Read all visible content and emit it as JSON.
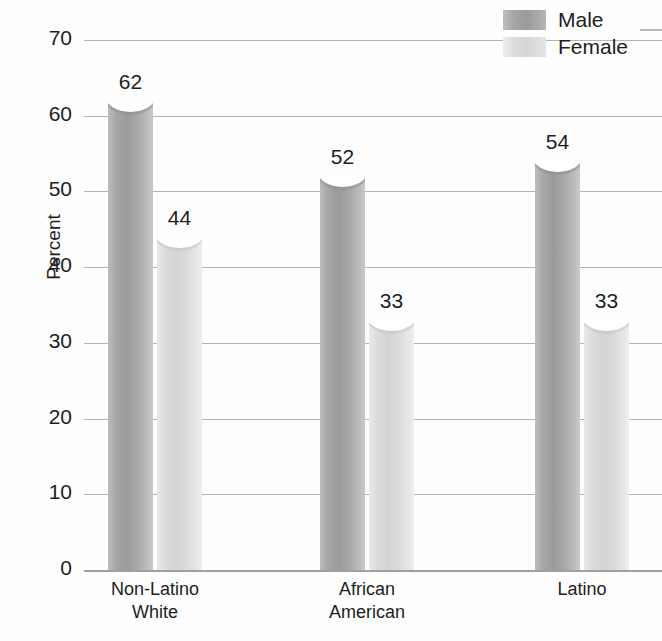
{
  "chart_data": {
    "type": "bar",
    "title": "",
    "xlabel": "",
    "ylabel": "Percent",
    "ylim": [
      0,
      70
    ],
    "ytick_step": 10,
    "grid": true,
    "legend_position": "top-right",
    "categories": [
      "Non-Latino\nWhite",
      "African\nAmerican",
      "Latino"
    ],
    "yticks": [
      "0",
      "10",
      "20",
      "30",
      "40",
      "50",
      "60",
      "70"
    ],
    "series": [
      {
        "name": "Male",
        "values": [
          62,
          52,
          54
        ],
        "color": "#a6a6a6"
      },
      {
        "name": "Female",
        "values": [
          44,
          33,
          33
        ],
        "color": "#dcdcdc"
      }
    ]
  },
  "axis": {
    "y_title": "Percent",
    "ticks": [
      {
        "label": "70",
        "value": 70
      },
      {
        "label": "60",
        "value": 60
      },
      {
        "label": "50",
        "value": 50
      },
      {
        "label": "40",
        "value": 40
      },
      {
        "label": "30",
        "value": 30
      },
      {
        "label": "20",
        "value": 20
      },
      {
        "label": "10",
        "value": 10
      },
      {
        "label": "0",
        "value": 0
      }
    ]
  },
  "groups": [
    {
      "label": "Non-Latino\nWhite",
      "bars": [
        {
          "series": "Male",
          "value": 62,
          "value_label": "62"
        },
        {
          "series": "Female",
          "value": 44,
          "value_label": "44"
        }
      ]
    },
    {
      "label": "African\nAmerican",
      "bars": [
        {
          "series": "Male",
          "value": 52,
          "value_label": "52"
        },
        {
          "series": "Female",
          "value": 33,
          "value_label": "33"
        }
      ]
    },
    {
      "label": "Latino",
      "bars": [
        {
          "series": "Male",
          "value": 54,
          "value_label": "54"
        },
        {
          "series": "Female",
          "value": 33,
          "value_label": "33"
        }
      ]
    }
  ],
  "legend": {
    "items": [
      {
        "label": "Male",
        "color": "#a6a6a6"
      },
      {
        "label": "Female",
        "color": "#dcdcdc"
      }
    ]
  }
}
